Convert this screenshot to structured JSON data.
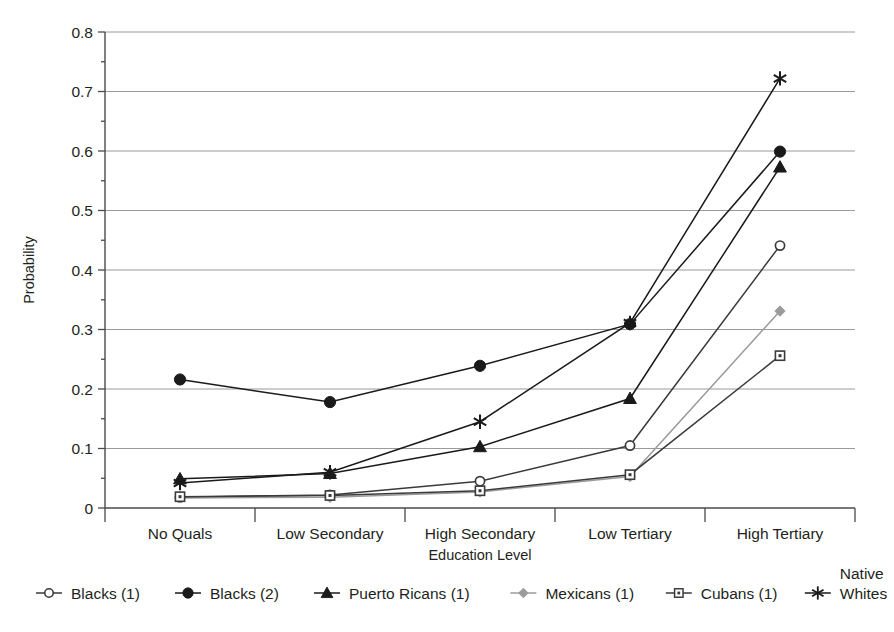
{
  "chart_data": {
    "type": "line",
    "title": "",
    "xlabel": "Education Level",
    "ylabel": "Probability",
    "categories": [
      "No Quals",
      "Low Secondary",
      "High Secondary",
      "Low Tertiary",
      "High Tertiary"
    ],
    "ylim": [
      0,
      0.8
    ],
    "ytick_labels": [
      "0",
      "0.1",
      "0.2",
      "0.3",
      "0.4",
      "0.5",
      "0.6",
      "0.7",
      "0.8"
    ],
    "ytick_values": [
      0,
      0.1,
      0.2,
      0.3,
      0.4,
      0.5,
      0.6,
      0.7,
      0.8
    ],
    "grid": true,
    "legend_position": "bottom",
    "series": [
      {
        "name": "Blacks (1)",
        "marker": "open-circle",
        "color": "#3a3a3a",
        "values": [
          0.018,
          0.022,
          0.045,
          0.105,
          0.441
        ]
      },
      {
        "name": "Blacks (2)",
        "marker": "filled-circle",
        "color": "#1a1a1a",
        "values": [
          0.216,
          0.178,
          0.239,
          0.309,
          0.599
        ]
      },
      {
        "name": "Puerto Ricans (1)",
        "marker": "filled-triangle",
        "color": "#1a1a1a",
        "values": [
          0.049,
          0.058,
          0.103,
          0.184,
          0.573
        ]
      },
      {
        "name": "Mexicans (1)",
        "marker": "diamond",
        "color": "#9b9b9b",
        "values": [
          0.017,
          0.018,
          0.027,
          0.053,
          0.331
        ]
      },
      {
        "name": "Cubans (1)",
        "marker": "open-square",
        "color": "#3a3a3a",
        "values": [
          0.019,
          0.021,
          0.029,
          0.056,
          0.256
        ]
      },
      {
        "name": "Native Whites",
        "marker": "asterisk",
        "color": "#1a1a1a",
        "values": [
          0.042,
          0.06,
          0.145,
          0.311,
          0.722
        ]
      }
    ]
  },
  "legend": {
    "entries": [
      {
        "label": "Blacks (1)"
      },
      {
        "label": "Blacks (2)"
      },
      {
        "label": "Puerto Ricans (1)"
      },
      {
        "label": "Mexicans (1)"
      },
      {
        "label": "Cubans (1)"
      },
      {
        "label_line1": "Native",
        "label_line2": "Whites"
      }
    ]
  }
}
